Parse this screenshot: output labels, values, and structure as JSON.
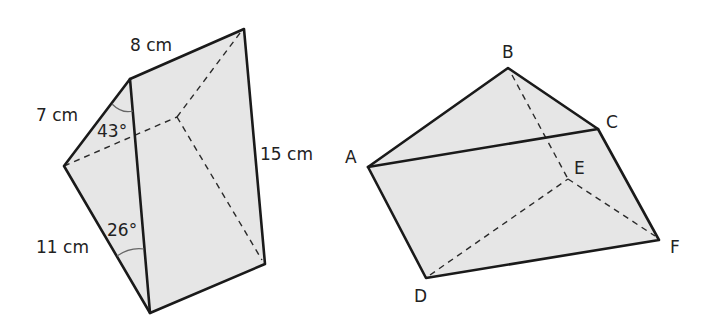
{
  "figures": [
    {
      "name": "left-prism",
      "labels": {
        "top_edge": "8 cm",
        "upper_left_edge": "7 cm",
        "lower_left_edge": "11 cm",
        "right_edge": "15 cm",
        "angle_top": "43°",
        "angle_bottom": "26°"
      }
    },
    {
      "name": "right-prism",
      "vertices": {
        "A": "A",
        "B": "B",
        "C": "C",
        "D": "D",
        "E": "E",
        "F": "F"
      }
    }
  ],
  "colors": {
    "face_fill": "#e6e6e6",
    "edge": "#1a1a1a"
  }
}
